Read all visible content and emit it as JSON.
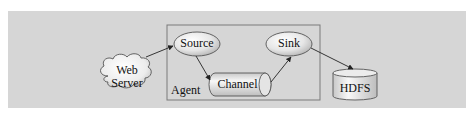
{
  "diagram": {
    "nodes": {
      "web_server": {
        "line1": "Web",
        "line2": "Server",
        "shape": "cloud"
      },
      "source": {
        "label": "Source",
        "shape": "ellipse"
      },
      "channel": {
        "label": "Channel",
        "shape": "horizontal-cylinder"
      },
      "sink": {
        "label": "Sink",
        "shape": "ellipse"
      },
      "hdfs": {
        "label": "HDFS",
        "shape": "cylinder"
      }
    },
    "container": {
      "label": "Agent"
    },
    "edges": [
      {
        "from": "Web Server",
        "to": "Source"
      },
      {
        "from": "Source",
        "to": "Channel"
      },
      {
        "from": "Channel",
        "to": "Sink"
      },
      {
        "from": "Sink",
        "to": "HDFS"
      }
    ],
    "colors": {
      "background_panel": "#d6d6d6",
      "node_fill_light": "#f4f4f4",
      "node_fill_dark": "#bdbdbd",
      "stroke": "#555555",
      "agent_border": "#7a7a7a"
    }
  }
}
